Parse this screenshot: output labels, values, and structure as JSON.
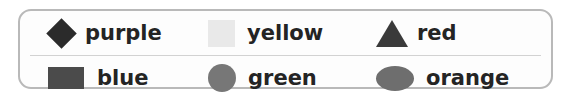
{
  "legend": {
    "border_color": "#b9b9b9",
    "background_color": "#fdfdfd",
    "divider_color": "#d2d2d2",
    "label_color": "#242424",
    "rows": [
      {
        "entries": [
          {
            "label": "purple",
            "icon": "diamond-swatch",
            "swatch_color": "#2b2b2b"
          },
          {
            "label": "yellow",
            "icon": "square-swatch",
            "swatch_color": "#e9e9e9"
          },
          {
            "label": "red",
            "icon": "triangle-swatch",
            "swatch_color": "#3a3a3a"
          }
        ]
      },
      {
        "entries": [
          {
            "label": "blue",
            "icon": "rectangle-swatch",
            "swatch_color": "#4b4b4b"
          },
          {
            "label": "green",
            "icon": "circle-swatch",
            "swatch_color": "#777777"
          },
          {
            "label": "orange",
            "icon": "ellipse-swatch",
            "swatch_color": "#6e6e6e"
          }
        ]
      }
    ]
  }
}
